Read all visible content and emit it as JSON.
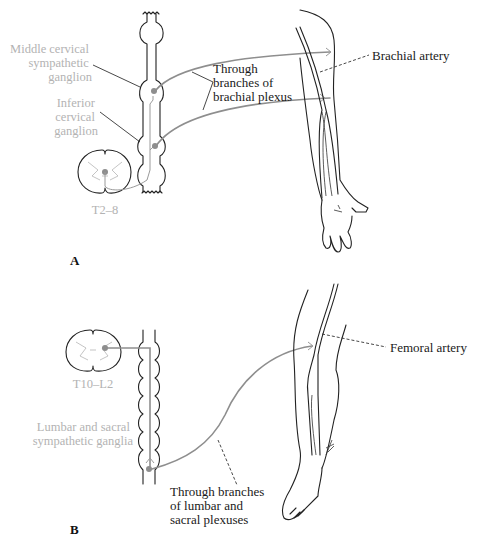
{
  "figure": {
    "colors": {
      "ink": "#222222",
      "nerve": "#8e8e8e",
      "gray_label": "#b3b3b3",
      "background": "#ffffff"
    }
  },
  "panel_a": {
    "label": "A",
    "labels": {
      "middle_ganglion": [
        "Middle cervical",
        "sympathetic",
        "ganglion"
      ],
      "inferior_ganglion": [
        "Inferior",
        "cervical",
        "ganglion"
      ],
      "cord_level": "T2–8",
      "plexus": [
        "Through",
        "branches of",
        "brachial plexus"
      ],
      "artery": "Brachial artery"
    }
  },
  "panel_b": {
    "label": "B",
    "labels": {
      "cord_level": "T10–L2",
      "ganglia": [
        "Lumbar and sacral",
        "sympathetic ganglia"
      ],
      "plexus": [
        "Through branches",
        "of lumbar and",
        "sacral plexuses"
      ],
      "artery": "Femoral artery"
    }
  }
}
